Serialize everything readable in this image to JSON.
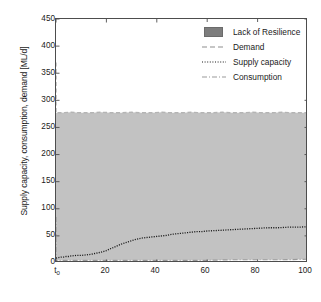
{
  "chart_data": {
    "type": "area",
    "title": "",
    "xlabel": "time [day]",
    "ylabel": "Supply capacity, consumption, demand [ML/d]",
    "xlim": [
      0,
      100
    ],
    "ylim": [
      0,
      450
    ],
    "grid": false,
    "legend_position": "upper right",
    "xticks": [
      {
        "value": 0,
        "label": "t",
        "sub": "0"
      },
      {
        "value": 20,
        "label": "20",
        "sub": ""
      },
      {
        "value": 40,
        "label": "40",
        "sub": ""
      },
      {
        "value": 60,
        "label": "60",
        "sub": ""
      },
      {
        "value": 80,
        "label": "80",
        "sub": ""
      },
      {
        "value": 100,
        "label": "100",
        "sub": ""
      }
    ],
    "yticks": [
      {
        "value": 0,
        "label": "0"
      },
      {
        "value": 50,
        "label": "50"
      },
      {
        "value": 100,
        "label": "100"
      },
      {
        "value": 150,
        "label": "150"
      },
      {
        "value": 200,
        "label": "200"
      },
      {
        "value": 250,
        "label": "250"
      },
      {
        "value": 300,
        "label": "300"
      },
      {
        "value": 350,
        "label": "350"
      },
      {
        "value": 400,
        "label": "400"
      },
      {
        "value": 450,
        "label": "450"
      }
    ],
    "colors": {
      "resilience_fill": "#c2c2c2",
      "demand": "#b4b4b4",
      "supply": "#1a1a1a",
      "consumption": "#9a9a9a",
      "axis": "#4d4d4d",
      "legend_patch": "#7d7d7d"
    },
    "legend": [
      {
        "label": "Lack of Resilience",
        "key": "patch"
      },
      {
        "label": "Demand",
        "key": "dashed"
      },
      {
        "label": "Supply capacity",
        "key": "dotted"
      },
      {
        "label": "Consumption",
        "key": "dashdot"
      }
    ],
    "series": [
      {
        "name": "Demand",
        "style": "dashed",
        "x": [
          0,
          0,
          2,
          6,
          10,
          14,
          18,
          22,
          26,
          30,
          34,
          38,
          42,
          46,
          50,
          54,
          58,
          62,
          66,
          70,
          74,
          78,
          82,
          86,
          90,
          94,
          98,
          100
        ],
        "values": [
          370,
          277,
          277,
          278,
          277,
          277,
          278,
          277,
          277,
          278,
          277,
          277,
          278,
          277,
          277,
          278,
          277,
          277,
          278,
          277,
          277,
          278,
          277,
          277,
          278,
          277,
          277,
          277
        ]
      },
      {
        "name": "Supply capacity",
        "style": "dotted",
        "x": [
          0,
          1,
          2,
          3,
          4,
          5,
          6,
          8,
          10,
          12,
          14,
          16,
          18,
          20,
          22,
          24,
          26,
          28,
          30,
          32,
          34,
          36,
          38,
          40,
          42,
          44,
          46,
          48,
          50,
          52,
          54,
          56,
          58,
          60,
          64,
          68,
          72,
          76,
          80,
          84,
          88,
          92,
          96,
          100
        ],
        "values": [
          9,
          10,
          11,
          11,
          12,
          12,
          13,
          14,
          14,
          15,
          16,
          18,
          20,
          23,
          27,
          31,
          35,
          38,
          41,
          44,
          46,
          47,
          48,
          49,
          50,
          51,
          53,
          54,
          55,
          56,
          57,
          58,
          58,
          59,
          60,
          61,
          62,
          63,
          64,
          65,
          65,
          66,
          66,
          67
        ]
      },
      {
        "name": "Consumption",
        "style": "dashdot",
        "x": [
          0,
          0,
          4,
          8,
          12,
          16,
          20,
          30,
          40,
          50,
          60,
          70,
          80,
          90,
          100
        ],
        "values": [
          85,
          5,
          5,
          5,
          5,
          5,
          5,
          5,
          5,
          5,
          5,
          6,
          6,
          6,
          7
        ]
      }
    ],
    "band": {
      "name": "Lack of Resilience",
      "description": "Shaded region between Consumption and Demand",
      "lower_from": "Consumption",
      "upper_from": "Demand"
    }
  }
}
